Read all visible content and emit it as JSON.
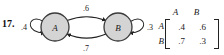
{
  "exercise": {
    "number": "17."
  },
  "diagram": {
    "type": "markov-state-diagram",
    "nodes": [
      {
        "id": "A",
        "label": "A",
        "cx": 55,
        "cy": 27,
        "r": 14,
        "fill": "#d4d4d4",
        "stroke": "#3a3a3a"
      },
      {
        "id": "B",
        "label": "B",
        "cx": 118,
        "cy": 27,
        "r": 14,
        "fill": "#d4d4d4",
        "stroke": "#3a3a3a"
      }
    ],
    "self_loops": [
      {
        "node": "A",
        "label": ".4",
        "side": "left",
        "label_x": 24,
        "label_y": 28
      },
      {
        "node": "B",
        "label": ".3",
        "side": "right",
        "label_x": 149,
        "label_y": 28
      }
    ],
    "edges": [
      {
        "from": "A",
        "to": "B",
        "label": ".6",
        "position": "top",
        "label_x": 86,
        "label_y": 11
      },
      {
        "from": "B",
        "to": "A",
        "label": ".7",
        "position": "bottom",
        "label_x": 86,
        "label_y": 50
      }
    ]
  },
  "matrix": {
    "column_labels": [
      "A",
      "B"
    ],
    "row_labels": [
      "A",
      "B"
    ],
    "rows": [
      [
        ".4",
        ".6"
      ],
      [
        ".7",
        ".3"
      ]
    ]
  }
}
